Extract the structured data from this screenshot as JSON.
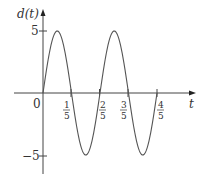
{
  "chart_data": {
    "type": "line",
    "title": "",
    "xlabel": "t",
    "ylabel": "d(t)",
    "function": "d(t) = 5 sin(5πt)",
    "x_ticks": [
      "1/5",
      "2/5",
      "3/5",
      "4/5"
    ],
    "x_tick_values": [
      0.2,
      0.4,
      0.6,
      0.8
    ],
    "y_ticks": [
      "5",
      "−5"
    ],
    "y_tick_values": [
      5,
      -5
    ],
    "origin_label": "0",
    "xlim": [
      0,
      0.8
    ],
    "ylim": [
      -5,
      5
    ],
    "grid": false,
    "series": [
      {
        "name": "d(t)",
        "x": [
          0,
          0.1,
          0.2,
          0.3,
          0.4,
          0.5,
          0.6,
          0.7,
          0.8
        ],
        "values": [
          0,
          5,
          0,
          -5,
          0,
          5,
          0,
          -5,
          0
        ]
      }
    ]
  }
}
